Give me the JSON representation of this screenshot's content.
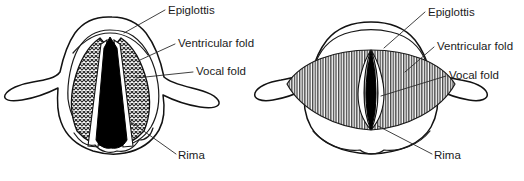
{
  "figure": {
    "background_color": "#ffffff",
    "ink_color": "#111111",
    "label_color": "#1b1b1b",
    "panels": [
      {
        "id": "left",
        "state_name": "abducted-open-glottis",
        "glottis_shape": "triangular",
        "glottis_fill": "#000000",
        "hatch_style": "cross-hatch",
        "labels": [
          {
            "key": "epiglottis",
            "text": "Epiglottis",
            "x": 168,
            "y": 11
          },
          {
            "key": "ventricular_fold",
            "text": "Ventricular fold",
            "x": 178,
            "y": 44
          },
          {
            "key": "vocal_fold",
            "text": "Vocal fold",
            "x": 196,
            "y": 72
          },
          {
            "key": "rima",
            "text": "Rima",
            "x": 178,
            "y": 156
          }
        ]
      },
      {
        "id": "right",
        "state_name": "adducted-closed-glottis",
        "glottis_shape": "narrow-slit",
        "glottis_fill": "#000000",
        "hatch_style": "vertical-lines",
        "labels": [
          {
            "key": "epiglottis",
            "text": "Epiglottis",
            "x": 428,
            "y": 13
          },
          {
            "key": "ventricular_fold",
            "text": "Ventricular fold",
            "x": 437,
            "y": 47
          },
          {
            "key": "vocal_fold",
            "text": "Vocal fold",
            "x": 449,
            "y": 76
          },
          {
            "key": "rima",
            "text": "Rima",
            "x": 434,
            "y": 156
          }
        ]
      }
    ]
  }
}
